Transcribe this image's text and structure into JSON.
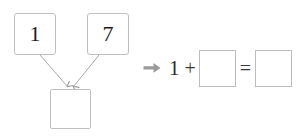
{
  "worksheet": {
    "type": "number-bond-with-equation",
    "background_color": "#ffffff",
    "line_color": "#c0c0c0",
    "text_color": "#1d1d1d",
    "arrow_color": "#999999"
  },
  "number_bond": {
    "label": "number-bond",
    "part_one": "1",
    "part_two": "7",
    "whole": "",
    "whole_placeholder": "",
    "connector_one_name": "arrow-part-one-to-whole",
    "connector_two_name": "arrow-part-two-to-whole"
  },
  "equation": {
    "prefix_icon": "arrow-right-icon",
    "operand_one": "1",
    "plus": "+",
    "operand_two": "",
    "equals": "=",
    "result": ""
  }
}
